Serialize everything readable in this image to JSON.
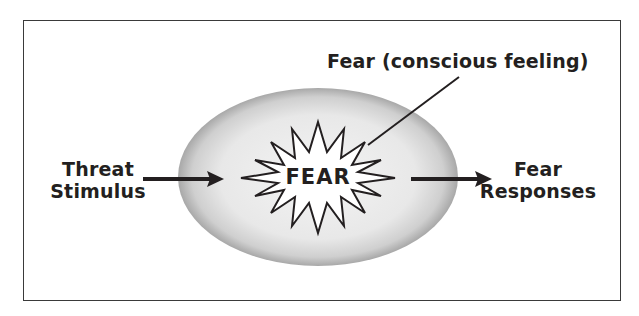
{
  "diagram": {
    "title_label": "Fear (conscious feeling)",
    "input": {
      "line1": "Threat",
      "line2": "Stimulus"
    },
    "core": {
      "label": "FEAR",
      "shape": "starburst",
      "container": "shaded-ellipse"
    },
    "output": {
      "line1": "Fear",
      "line2": "Responses"
    },
    "edges": [
      {
        "from": "Threat Stimulus",
        "to": "FEAR",
        "type": "arrow"
      },
      {
        "from": "FEAR",
        "to": "Fear Responses",
        "type": "arrow"
      },
      {
        "from": "Fear (conscious feeling)",
        "to": "FEAR",
        "type": "pointer-line"
      }
    ],
    "colors": {
      "ink": "#231f20",
      "ellipse_fill": "#e6e6e6",
      "ellipse_edge": "#8c8c8c",
      "frame": "#3a3a3a"
    }
  }
}
